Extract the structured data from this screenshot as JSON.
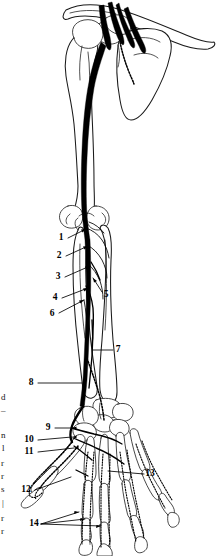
{
  "figure": {
    "background_color": "#ffffff",
    "line_color": "#000000",
    "width": 216,
    "height": 556
  },
  "labels": [
    {
      "id": "1",
      "text": "1",
      "x": 61,
      "y": 238,
      "leader": "M 68 238 L 86 229"
    },
    {
      "id": "2",
      "text": "2",
      "x": 59,
      "y": 256,
      "leader": "M 66 256 L 88 246"
    },
    {
      "id": "3",
      "text": "3",
      "x": 58,
      "y": 277,
      "leader": "M 65 277 L 90 266"
    },
    {
      "id": "4",
      "text": "4",
      "x": 55,
      "y": 298,
      "leader": "M 62 298 L 88 288"
    },
    {
      "id": "5",
      "text": "5",
      "x": 105,
      "y": 294,
      "leader": "M 102 292 L 93 278"
    },
    {
      "id": "6",
      "text": "6",
      "x": 52,
      "y": 314,
      "leader": "M 59 313 L 84 300"
    },
    {
      "id": "7",
      "text": "7",
      "x": 117,
      "y": 350,
      "leader": "M 113 350 L 93 350"
    },
    {
      "id": "8",
      "text": "8",
      "x": 31,
      "y": 383,
      "leader": "M 38 383 L 82 383"
    },
    {
      "id": "9",
      "text": "9",
      "x": 48,
      "y": 428,
      "leader": "M 55 428 L 72 428"
    },
    {
      "id": "10",
      "text": "10",
      "x": 27,
      "y": 440,
      "leader": "M 38 440 L 72 437"
    },
    {
      "id": "11",
      "text": "11",
      "x": 27,
      "y": 452,
      "leader": "M 38 452 L 74 448"
    },
    {
      "id": "12",
      "text": "12",
      "x": 24,
      "y": 490,
      "leader": "M 35 490 L 71 477"
    },
    {
      "id": "13",
      "text": "13",
      "x": 148,
      "y": 474,
      "leader": "M 144 474 L 108 471"
    },
    {
      "id": "14",
      "text": "14",
      "x": 33,
      "y": 524,
      "leader": "M 41 524 L 79 512 M 41 524 L 85 519 M 41 524 L 101 526"
    }
  ],
  "edge_fragments": [
    {
      "text": "d",
      "x": 1,
      "y": 400
    },
    {
      "text": "–",
      "x": 1,
      "y": 413
    },
    {
      "text": "n",
      "x": 1,
      "y": 438
    },
    {
      "text": "l",
      "x": 2,
      "y": 451
    },
    {
      "text": "r",
      "x": 1,
      "y": 466
    },
    {
      "text": "r",
      "x": 1,
      "y": 479
    },
    {
      "text": "s",
      "x": 1,
      "y": 492
    },
    {
      "text": "|",
      "x": 2,
      "y": 506
    },
    {
      "text": "r",
      "x": 1,
      "y": 521
    },
    {
      "text": "r",
      "x": 1,
      "y": 534
    }
  ],
  "bones": [
    {
      "name": "clavicle"
    },
    {
      "name": "scapula"
    },
    {
      "name": "humerus"
    },
    {
      "name": "radius"
    },
    {
      "name": "ulna"
    },
    {
      "name": "carpals"
    },
    {
      "name": "metacarpals"
    },
    {
      "name": "phalanges"
    }
  ],
  "nerves": [
    {
      "name": "brachial-plexus-roots"
    },
    {
      "name": "main-nerve-trunk"
    },
    {
      "name": "elbow-branches"
    },
    {
      "name": "forearm-branch"
    },
    {
      "name": "hand-branches"
    },
    {
      "name": "digital-branches"
    }
  ]
}
